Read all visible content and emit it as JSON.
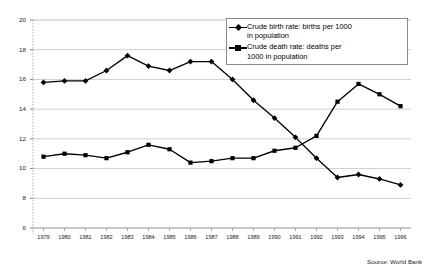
{
  "chart_data": {
    "type": "line",
    "title": "",
    "xlabel": "",
    "ylabel": "",
    "ylim": [
      6,
      20
    ],
    "ytick_step": 2,
    "yticks": [
      6,
      8,
      10,
      12,
      14,
      16,
      18,
      20
    ],
    "grid": true,
    "legend_position": "top-right",
    "categories": [
      "1979",
      "1980",
      "1981",
      "1982",
      "1983",
      "1984",
      "1985",
      "1986",
      "1987",
      "1988",
      "1989",
      "1990",
      "1991",
      "1992",
      "1993",
      "1994",
      "1995",
      "1996"
    ],
    "series": [
      {
        "name": "Crude birth rate:  births per 1000\nin population",
        "legend_label": "Crude birth rate:  births per 1000 in population",
        "marker": "diamond",
        "color": "#000000",
        "values": [
          15.8,
          15.9,
          15.9,
          16.6,
          17.6,
          16.9,
          16.6,
          17.2,
          17.2,
          16.0,
          14.6,
          13.4,
          12.1,
          10.7,
          9.4,
          9.6,
          9.3,
          8.9
        ]
      },
      {
        "name": "Crude death rate: deaths per\n1000 in population",
        "legend_label": "Crude death rate: deaths per 1000 in population",
        "marker": "square",
        "color": "#000000",
        "values": [
          10.8,
          11.0,
          10.9,
          10.7,
          11.1,
          11.6,
          11.3,
          10.4,
          10.5,
          10.7,
          10.7,
          11.2,
          11.4,
          12.2,
          14.5,
          15.7,
          15.0,
          14.2
        ]
      }
    ],
    "source_note": "Source: World Bank"
  }
}
